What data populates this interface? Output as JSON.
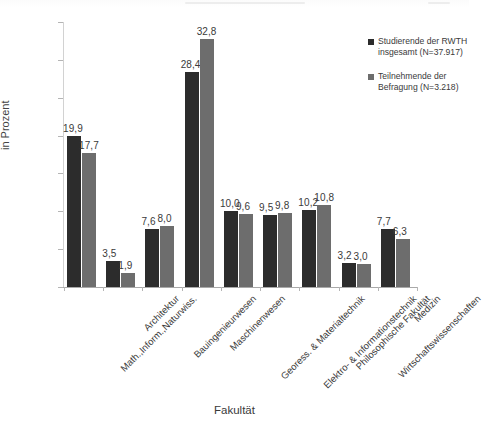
{
  "chart_data": {
    "type": "bar",
    "title": "",
    "xlabel": "Fakultät",
    "ylabel": "in Prozent",
    "ylim": [
      0,
      35
    ],
    "yticks": [
      0,
      5,
      10,
      15,
      20,
      25,
      30,
      35
    ],
    "grid": false,
    "legend_position": "right",
    "value_label_format": "comma-decimal",
    "categories": [
      "Math.,Inform.,Naturwiss.",
      "Architektur",
      "Bauingenieurwesen",
      "Maschinenwesen",
      "Georess. & Materialtechnik",
      "Elektro- & Informationstechnik",
      "Philosophische Fakultät",
      "Wirtschaftswissenschaften",
      "Medizin"
    ],
    "series": [
      {
        "name": "Studierende der RWTH insgesamt (N=37.917)",
        "color": "#2c2c2c",
        "values": [
          19.9,
          3.5,
          7.6,
          28.4,
          10.0,
          9.5,
          10.2,
          3.2,
          7.7
        ],
        "labels": [
          "19,9",
          "3,5",
          "7,6",
          "28,4",
          "10,0",
          "9,5",
          "10,2",
          "3,2",
          "7,7"
        ]
      },
      {
        "name": "Teilnehmende der Befragung (N=3.218)",
        "color": "#6d6d6d",
        "values": [
          17.7,
          1.9,
          8.0,
          32.8,
          9.6,
          9.8,
          10.8,
          3.0,
          6.3
        ],
        "labels": [
          "17,7",
          "1,9",
          "8,0",
          "32,8",
          "9,6",
          "9,8",
          "10,8",
          "3,0",
          "6,3"
        ]
      }
    ]
  },
  "legend": {
    "items": [
      {
        "label": "Studierende der RWTH insgesamt (N=37.917)",
        "color": "#2c2c2c"
      },
      {
        "label": "Teilnehmende der Befragung (N=3.218)",
        "color": "#6d6d6d"
      }
    ]
  },
  "axes": {
    "y_title": "in Prozent",
    "x_title": "Fakultät",
    "y_tick_labels": [
      "0",
      "5",
      "10",
      "15",
      "20",
      "25",
      "30",
      "35"
    ]
  }
}
